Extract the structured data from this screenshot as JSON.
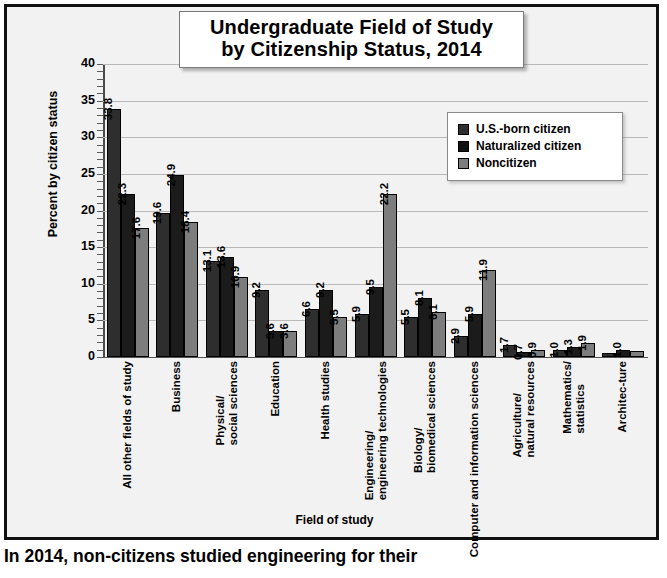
{
  "figure": {
    "title_line1": "Undergraduate Field of Study",
    "title_line2": "by Citizenship Status, 2014",
    "caption": "In 2014, non-citizens studied engineering for their"
  },
  "legend": {
    "items": [
      {
        "label": "U.S.-born citizen",
        "color": "#2e2e2e"
      },
      {
        "label": "Naturalized citizen",
        "color": "#111111"
      },
      {
        "label": "Noncitizen",
        "color": "#7d7d7d"
      }
    ]
  },
  "axes": {
    "ylabel": "Percent by citizen status",
    "xlabel": "Field of study",
    "yticks": [
      "40",
      "35",
      "30",
      "25",
      "20",
      "15",
      "10",
      "5",
      "0"
    ]
  },
  "chart_data": {
    "type": "bar",
    "title": "Undergraduate Field of Study by Citizenship Status, 2014",
    "xlabel": "Field of study",
    "ylabel": "Percent by citizen status",
    "ylim": [
      0,
      40
    ],
    "ytick_step": 5,
    "grid": true,
    "legend_position": "upper-right-inside",
    "categories": [
      "All other fields of study",
      "Business",
      "Physical/ social sciences",
      "Education",
      "Health studies",
      "Engineering/ engineering technologies",
      "Biology/ biomedical sciences",
      "Computer and information sciences",
      "Agriculture/ natural resources",
      "Mathematics/ statistics",
      "Architec-ture"
    ],
    "series": [
      {
        "name": "U.S.-born citizen",
        "color": "#2e2e2e",
        "values": [
          33.8,
          19.6,
          13.1,
          9.2,
          6.6,
          5.9,
          5.5,
          2.9,
          1.7,
          1.0,
          0.6
        ],
        "labels": [
          "33.8",
          "19.6",
          "13.1",
          "9.2",
          "6.6",
          "5.9",
          "5.5",
          "2.9",
          "1.7",
          "1.0",
          ""
        ]
      },
      {
        "name": "Naturalized citizen",
        "color": "#1b1b1b",
        "values": [
          22.3,
          24.9,
          13.6,
          3.6,
          9.2,
          9.5,
          8.1,
          5.9,
          0.7,
          1.3,
          1.0
        ],
        "labels": [
          "22.3",
          "24.9",
          "13.6",
          "3.6",
          "9.2",
          "9.5",
          "8.1",
          "5.9",
          "0.7",
          "1.3",
          "1.0"
        ]
      },
      {
        "name": "Noncitizen",
        "color": "#7d7d7d",
        "values": [
          17.6,
          18.4,
          10.9,
          3.6,
          5.5,
          22.2,
          6.1,
          11.9,
          0.9,
          1.9,
          0.8
        ],
        "labels": [
          "17.6",
          "18.4",
          "10.9",
          "3.6",
          "5.5",
          "22.2",
          "6.1",
          "11.9",
          "0.9",
          "1.9",
          ""
        ]
      }
    ]
  }
}
